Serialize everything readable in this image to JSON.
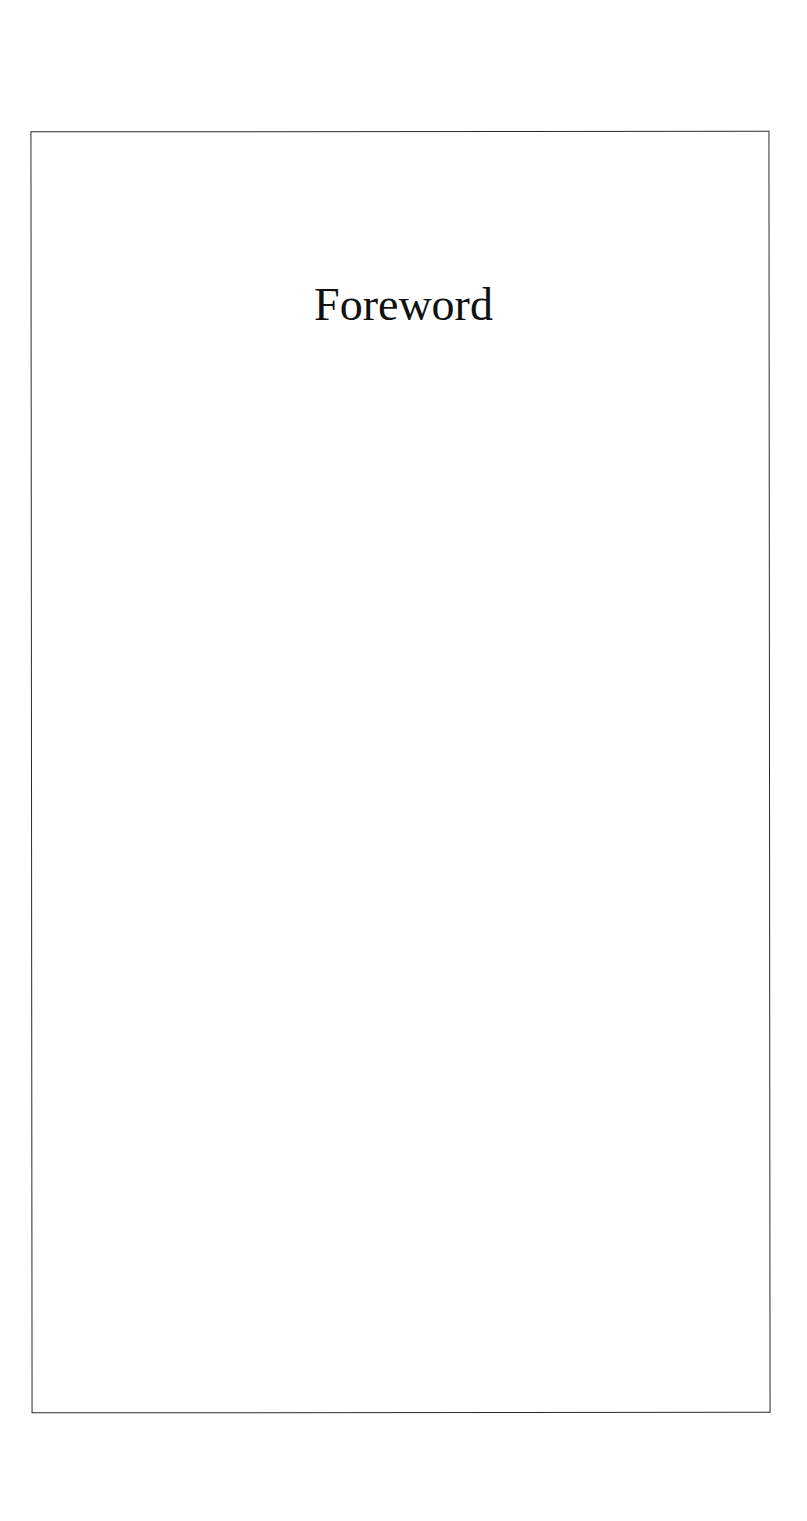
{
  "page": {
    "title": "Foreword",
    "colors": {
      "background": "#ffffff",
      "frame": "#2a2a2a",
      "text": "#111111"
    }
  }
}
